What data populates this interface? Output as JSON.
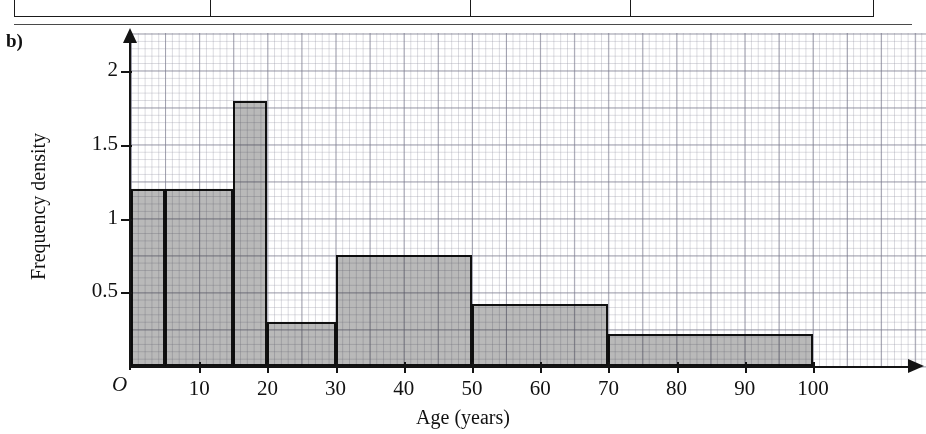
{
  "part_label": "b)",
  "chart_data": {
    "type": "bar",
    "title": "",
    "subtitle": "",
    "xlabel": "Age (years)",
    "ylabel": "Frequency density",
    "xlim": [
      0,
      100
    ],
    "ylim": [
      0,
      2.2
    ],
    "grid": true,
    "grid_style": "graph-paper",
    "legend": "none",
    "x_ticks": [
      10,
      20,
      30,
      40,
      50,
      60,
      70,
      80,
      90,
      100
    ],
    "x_tick_labels": [
      "10",
      "20",
      "30",
      "40",
      "50",
      "60",
      "70",
      "80",
      "90",
      "100"
    ],
    "y_ticks": [
      0.5,
      1,
      1.5,
      2
    ],
    "y_tick_labels": [
      "0.5",
      "1",
      "1.5",
      "2"
    ],
    "origin_label": "O",
    "bar_fill_color": "#b9b9b9",
    "bar_edge_color": "#111111",
    "bins": [
      {
        "label": "0-5",
        "start": 0,
        "end": 5,
        "width": 5,
        "density": 1.2,
        "frequency": 6
      },
      {
        "label": "5-15",
        "start": 5,
        "end": 15,
        "width": 10,
        "density": 1.2,
        "frequency": 12
      },
      {
        "label": "15-20",
        "start": 15,
        "end": 20,
        "width": 5,
        "density": 1.8,
        "frequency": 9
      },
      {
        "label": "20-30",
        "start": 20,
        "end": 30,
        "width": 10,
        "density": 0.3,
        "frequency": 3
      },
      {
        "label": "30-50",
        "start": 30,
        "end": 50,
        "width": 20,
        "density": 0.75,
        "frequency": 15
      },
      {
        "label": "50-70",
        "start": 50,
        "end": 70,
        "width": 20,
        "density": 0.42,
        "frequency": 8.4
      },
      {
        "label": "70-100",
        "start": 70,
        "end": 100,
        "width": 30,
        "density": 0.22,
        "frequency": 6.6
      }
    ]
  }
}
